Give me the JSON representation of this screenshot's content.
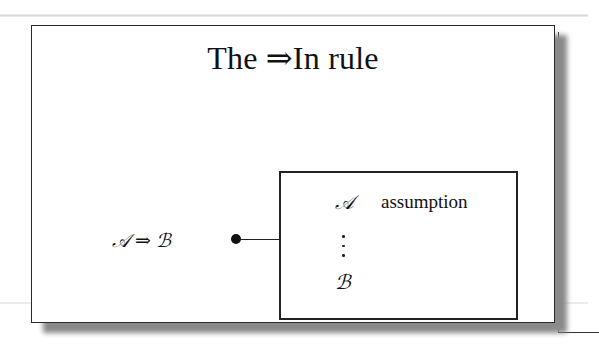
{
  "slide": {
    "title": "The ⇒In rule",
    "formula": {
      "left": "𝒜",
      "connective": "⇒",
      "right": "ℬ"
    },
    "subproof": {
      "assumption_formula": "𝒜",
      "assumption_label": "assumption",
      "ellipsis": "vertical-dots",
      "conclusion_formula": "ℬ"
    }
  }
}
